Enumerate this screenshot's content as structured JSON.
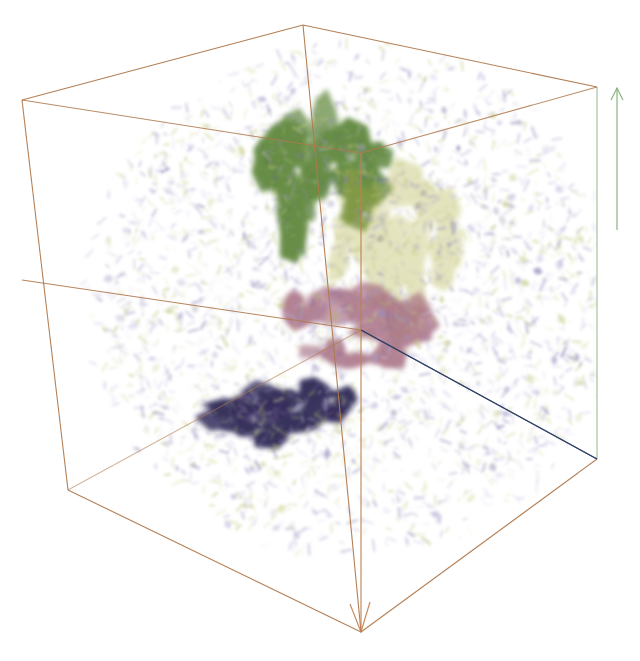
{
  "figure": {
    "kind": "3d-volume-rendering",
    "width": 640,
    "height": 661,
    "background_color": "#ffffff",
    "title": "",
    "caption": ""
  },
  "bounding_box": {
    "name": "domain-bounding-box",
    "edge_color": "#b07a4e",
    "edge_width": 1.1,
    "style": "wireframe-perspective-cube",
    "vertices": {
      "left_top": [
        22,
        100
      ],
      "front_top": [
        303,
        25
      ],
      "back_top_right": [
        597,
        87
      ],
      "center_top_hidden": [
        361,
        153
      ],
      "left_bottom": [
        68,
        490
      ],
      "front_bottom": [
        361,
        632
      ],
      "right_bottom": [
        597,
        459
      ],
      "center_bottom_hidden": [
        340,
        390
      ]
    }
  },
  "axes": [
    {
      "name": "axis-y-up",
      "color": "#7fae72",
      "from": [
        617,
        230
      ],
      "to": [
        617,
        88
      ],
      "arrow": "up",
      "label": ""
    },
    {
      "name": "axis-z-down",
      "color": "#c08050",
      "from": [
        361,
        153
      ],
      "to": [
        361,
        632
      ],
      "arrow": "down",
      "label": ""
    },
    {
      "name": "axis-x-right",
      "color": "#2f3f66",
      "from": [
        361,
        330
      ],
      "to": [
        597,
        459
      ],
      "arrow": "none",
      "label": ""
    },
    {
      "name": "axis-edge-left",
      "color": "#b07a4e",
      "from": [
        361,
        330
      ],
      "to": [
        22,
        280
      ],
      "arrow": "none",
      "label": ""
    }
  ],
  "volume_glyphs": {
    "name": "vector-glyph-cloud",
    "description": "dense field of short oriented dashes filling the box interior",
    "primary_color": "#9b93c4",
    "secondary_color": "#b9bf6e",
    "highlight_color": "#6b63a0",
    "background_fill": "#ffffff",
    "count": 2600,
    "opacity": 0.75
  },
  "isosurfaces": [
    {
      "name": "isosurface-green",
      "label": "green",
      "color": "#4d7a28",
      "opacity": 0.85,
      "center": [
        322,
        178
      ],
      "radius_x": 62,
      "radius_y": 58,
      "blob_count": 26,
      "seed": 11
    },
    {
      "name": "isosurface-olive",
      "label": "olive-translucent",
      "color": "#b0b045",
      "opacity": 0.35,
      "center": [
        400,
        258
      ],
      "radius_x": 64,
      "radius_y": 72,
      "blob_count": 20,
      "seed": 29
    },
    {
      "name": "isosurface-pink",
      "label": "pink-mauve",
      "color": "#a3677d",
      "opacity": 0.82,
      "center": [
        355,
        325
      ],
      "radius_x": 72,
      "radius_y": 36,
      "blob_count": 24,
      "seed": 47
    },
    {
      "name": "isosurface-navy",
      "label": "dark-navy",
      "color": "#262050",
      "opacity": 0.92,
      "center": [
        290,
        412
      ],
      "radius_x": 78,
      "radius_y": 27,
      "blob_count": 22,
      "seed": 73
    }
  ],
  "chart_data": {
    "type": "scatter",
    "title": "",
    "xlabel": "",
    "ylabel": "",
    "legend": [],
    "series": [
      {
        "name": "glyph cloud",
        "color": "#9b93c4",
        "count": 2600
      },
      {
        "name": "green isosurface",
        "color": "#4d7a28",
        "count": 26
      },
      {
        "name": "olive isosurface",
        "color": "#b0b045",
        "count": 20
      },
      {
        "name": "pink isosurface",
        "color": "#a3677d",
        "count": 24
      },
      {
        "name": "navy isosurface",
        "color": "#262050",
        "count": 22
      }
    ]
  }
}
